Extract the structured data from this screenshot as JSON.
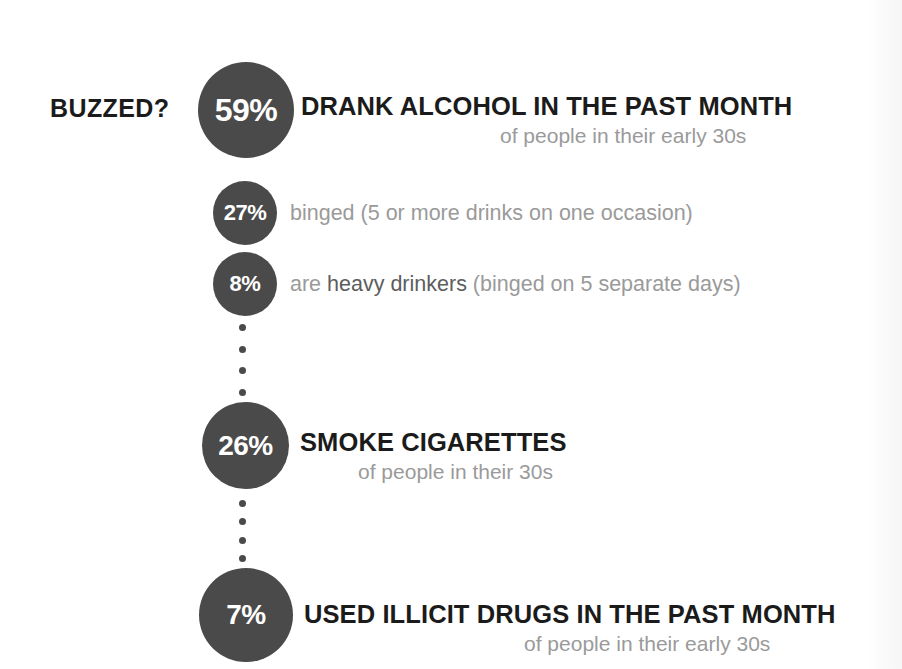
{
  "chart_data": {
    "type": "bar",
    "title": "BUZZED?",
    "subtitle": "",
    "xlabel": "",
    "ylabel": "",
    "categories": [
      "DRANK ALCOHOL IN THE PAST MONTH",
      "binged (5 or more drinks on one occasion)",
      "are heavy drinkers (binged on 5 separate days)",
      "SMOKE CIGARETTES",
      "USED ILLICIT DRUGS IN THE PAST MONTH"
    ],
    "values": [
      59,
      27,
      8,
      26,
      7
    ],
    "units": "percent",
    "ylim": [
      0,
      100
    ],
    "legend": [],
    "grid": false,
    "notes": [
      "of people in their early 30s",
      "of people in their 30s",
      "of people in their early 30s"
    ]
  },
  "colors": {
    "bubble": "#4a4a4a",
    "bubble_text": "#ffffff",
    "headline_text": "#1b1b1b",
    "muted_text": "#9a9a9a",
    "emphasis_text": "#5d5d5d",
    "background": "#ffffff"
  },
  "side_label": "BUZZED?",
  "rows": [
    {
      "value": "59%",
      "headline": "DRANK ALCOHOL IN THE PAST MONTH",
      "subline": "of people in their early 30s"
    },
    {
      "value": "27%",
      "detail_before": "binged (5 or more drinks on one occasion)",
      "detail_emphasis": "",
      "detail_after": ""
    },
    {
      "value": "8%",
      "detail_before": "are ",
      "detail_emphasis": "heavy drinkers",
      "detail_after": " (binged on 5 separate days)"
    },
    {
      "value": "26%",
      "headline": "SMOKE CIGARETTES",
      "subline": "of people in their 30s"
    },
    {
      "value": "7%",
      "headline": "USED ILLICIT DRUGS IN THE PAST MONTH",
      "subline": "of people in their early 30s"
    }
  ],
  "connectors": {
    "dot_count_1": 4,
    "dot_count_2": 4
  }
}
